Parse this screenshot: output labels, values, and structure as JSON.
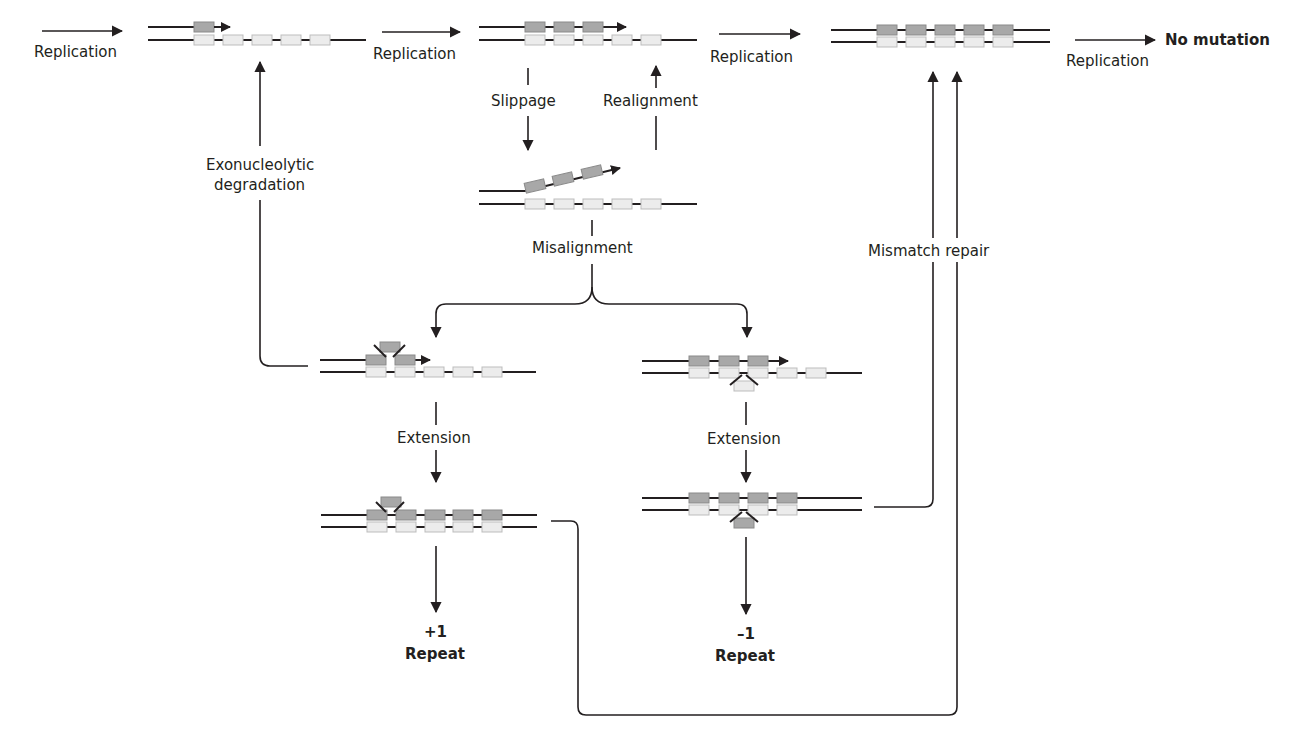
{
  "diagram": {
    "colors": {
      "line": "#231f20",
      "repeat_new_strand": "#a8a8a8",
      "repeat_template_strand": "#ececec",
      "background": "#ffffff"
    },
    "labels": {
      "replication_1": "Replication",
      "replication_2": "Replication",
      "replication_3": "Replication",
      "replication_4": "Replication",
      "no_mutation": "No mutation",
      "slippage": "Slippage",
      "realignment": "Realignment",
      "exonucleolytic_1": "Exonucleolytic",
      "exonucleolytic_2": "degradation",
      "misalignment": "Misalignment",
      "mismatch_repair": "Mismatch repair",
      "extension_left": "Extension",
      "extension_right": "Extension",
      "plus_one": "+1",
      "plus_repeat": "Repeat",
      "minus_one": "–1",
      "minus_repeat": "Repeat"
    },
    "nodes": [
      {
        "id": "start-duplex",
        "new_repeats": 1,
        "template_repeats": 5,
        "state": "replicating"
      },
      {
        "id": "mid-duplex",
        "new_repeats": 3,
        "template_repeats": 5,
        "state": "replicating"
      },
      {
        "id": "complete-duplex",
        "new_repeats": 5,
        "template_repeats": 5,
        "state": "complete"
      },
      {
        "id": "slipped-duplex",
        "new_repeats": 3,
        "template_repeats": 5,
        "state": "slipped"
      },
      {
        "id": "loop-new-strand",
        "new_repeats": 3,
        "template_repeats": 5,
        "state": "loop on new strand"
      },
      {
        "id": "loop-template-strand",
        "new_repeats": 3,
        "template_repeats": 5,
        "state": "loop on template strand"
      },
      {
        "id": "extended-plus",
        "new_repeats": 6,
        "template_repeats": 5,
        "state": "extended"
      },
      {
        "id": "extended-minus",
        "new_repeats": 4,
        "template_repeats": 5,
        "state": "extended"
      }
    ],
    "outcomes": [
      "No mutation",
      "+1 Repeat",
      "–1 Repeat"
    ]
  }
}
